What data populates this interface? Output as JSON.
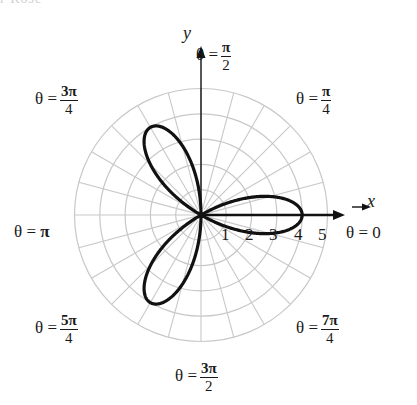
{
  "header_fragment": "r Rose",
  "axes": {
    "x_label": "x",
    "y_label": "y"
  },
  "angle_labels": {
    "zero": {
      "lhs": "θ =",
      "text": "0"
    },
    "pi_over_4": {
      "lhs": "θ =",
      "num": "π",
      "den": "4"
    },
    "pi_over_2": {
      "lhs": "θ =",
      "num": "π",
      "den": "2"
    },
    "three_pi_4": {
      "lhs": "θ =",
      "num": "3π",
      "den": "4"
    },
    "pi": {
      "lhs": "θ =",
      "text": "π"
    },
    "five_pi_4": {
      "lhs": "θ =",
      "num": "5π",
      "den": "4"
    },
    "three_pi_2": {
      "lhs": "θ =",
      "num": "3π",
      "den": "2"
    },
    "seven_pi_4": {
      "lhs": "θ =",
      "num": "7π",
      "den": "4"
    }
  },
  "radial_ticks": [
    "1",
    "2",
    "3",
    "4",
    "5"
  ],
  "colors": {
    "grid": "#c8c8c8",
    "curve": "#111111",
    "axis": "#111111"
  },
  "chart_data": {
    "type": "line",
    "title": "",
    "plot": "polar",
    "equation": "r = 4cos(3θ)",
    "curve_name": "three-petal rose",
    "petals": 3,
    "petal_length": 4,
    "petal_angles": [
      "0",
      "2π/3",
      "4π/3"
    ],
    "r_range": [
      0,
      5
    ],
    "r_ticks": [
      1,
      2,
      3,
      4,
      5
    ],
    "angular_grid_step_deg": 15,
    "angle_labels": [
      "0",
      "π/4",
      "π/2",
      "3π/4",
      "π",
      "5π/4",
      "3π/2",
      "7π/4"
    ],
    "xlabel": "x",
    "ylabel": "y",
    "grid": true
  }
}
